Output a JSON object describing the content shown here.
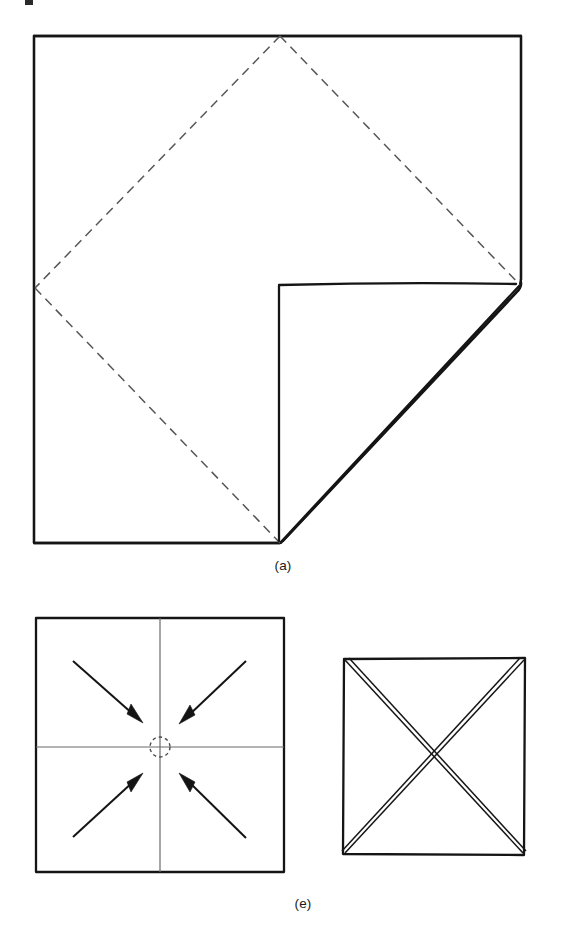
{
  "figure": {
    "background_color": "#ffffff",
    "ink_color": "#151515",
    "fold_line_color": "#565656",
    "width": 565,
    "height": 938
  },
  "panels": [
    {
      "id": "a",
      "caption": "(a)",
      "caption_x": 283,
      "caption_y": 570,
      "description": "Square napkin with one corner folded to the center",
      "square": {
        "left": 34,
        "top": 36,
        "right": 521,
        "bottom": 543
      },
      "fold_creases": [
        {
          "name": "top-to-left-diagonal",
          "x1": 280,
          "y1": 36,
          "x2": 35,
          "y2": 288
        },
        {
          "name": "top-to-right-diagonal",
          "x1": 280,
          "y1": 36,
          "x2": 520,
          "y2": 285
        },
        {
          "name": "left-to-bottom-diagonal",
          "x1": 35,
          "y1": 288,
          "x2": 280,
          "y2": 543
        }
      ],
      "folded_flap": {
        "name": "folded-corner-flap",
        "inner_corner": {
          "x": 279,
          "y": 285
        },
        "right_vertex": {
          "x": 520,
          "y": 285
        },
        "bottom_vertex": {
          "x": 280,
          "y": 543
        }
      }
    },
    {
      "id": "e-left",
      "caption": "",
      "description": "Square with cross creases and four arrows pointing inward to center",
      "square": {
        "left": 36,
        "top": 618,
        "right": 284,
        "bottom": 872
      },
      "center_marker": {
        "cx": 160,
        "cy": 747,
        "r": 10,
        "style": "dashed-circle"
      },
      "creases": [
        {
          "name": "vertical-crease",
          "x1": 160,
          "y1": 618,
          "x2": 160,
          "y2": 872
        },
        {
          "name": "horizontal-crease",
          "x1": 36,
          "y1": 747,
          "x2": 284,
          "y2": 747
        }
      ],
      "arrows": [
        {
          "name": "arrow-from-top-left",
          "x1": 73,
          "y1": 661,
          "x2": 141,
          "y2": 721,
          "direction": "down-right"
        },
        {
          "name": "arrow-from-top-right",
          "x1": 246,
          "y1": 661,
          "x2": 180,
          "y2": 722,
          "direction": "down-left"
        },
        {
          "name": "arrow-from-bottom-left",
          "x1": 73,
          "y1": 837,
          "x2": 141,
          "y2": 775,
          "direction": "up-right"
        },
        {
          "name": "arrow-from-bottom-right",
          "x1": 246,
          "y1": 838,
          "x2": 180,
          "y2": 775,
          "direction": "up-left"
        }
      ]
    },
    {
      "id": "e-right",
      "caption": "",
      "description": "Square with both diagonals creased forming an X",
      "square": {
        "left": 343,
        "top": 658,
        "right": 525,
        "bottom": 855
      },
      "diagonals": [
        {
          "name": "diagonal-tl-br",
          "x1": 343,
          "y1": 658,
          "x2": 525,
          "y2": 855
        },
        {
          "name": "diagonal-tr-bl",
          "x1": 525,
          "y1": 658,
          "x2": 343,
          "y2": 855
        }
      ]
    }
  ],
  "captions": {
    "panel_a": "(a)",
    "panel_e": "(e)"
  },
  "caption_positions": {
    "panel_a": {
      "x": 283,
      "y": 570
    },
    "panel_e": {
      "x": 303,
      "y": 908
    }
  }
}
